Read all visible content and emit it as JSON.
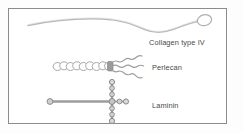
{
  "figure": {
    "background_color": "#fdfdfd",
    "frame_color": "#8c8c8c",
    "line_color": "#b9b9b9",
    "bead_fill": "#fefefe",
    "bead_stroke": "#a8a8a8",
    "node_color": "#8f8f8f",
    "label_color": "#4a4a4a"
  },
  "molecules": [
    {
      "id": "collagen-type-iv",
      "label": "Collagen type IV",
      "shape": "long gently undulating fibril with a globular head at the right end",
      "label_x": 149,
      "label_y": 39
    },
    {
      "id": "perlecan",
      "label": "Perlecan",
      "shape": "beaded core protein chain with three wavy glycosaminoglycan branches at right",
      "bead_count": 9,
      "branch_count": 3,
      "label_x": 152,
      "label_y": 64
    },
    {
      "id": "laminin",
      "label": "Laminin",
      "shape": "cross-shaped molecule: one long arm and three short arms, beaded",
      "arm_count": 4,
      "label_x": 152,
      "label_y": 102
    }
  ]
}
